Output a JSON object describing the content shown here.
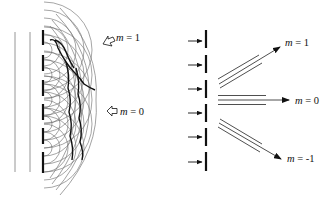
{
  "figure": {
    "colors": {
      "background": "#ffffff",
      "ink": "#111111",
      "wavelet": "#6a6a6a",
      "thin_line": "#8a8a8a"
    }
  },
  "left_panel": {
    "name": "wavelet-construction",
    "labels": {
      "order_1": {
        "var": "m",
        "eq": " = ",
        "value": "1"
      },
      "order_0": {
        "var": "m",
        "eq": " = ",
        "value": "0"
      }
    },
    "slit_count": 6
  },
  "right_panel": {
    "name": "diffraction-orders",
    "incident_arrow_count": 6,
    "labels": {
      "order_plus1": {
        "var": "m",
        "eq": " = ",
        "value": "1"
      },
      "order_0": {
        "var": "m",
        "eq": " = ",
        "value": "0"
      },
      "order_minus1": {
        "var": "m",
        "eq": " = ",
        "value": "-1"
      }
    }
  }
}
